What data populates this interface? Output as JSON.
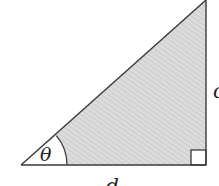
{
  "diagram": {
    "type": "right-triangle",
    "labels": {
      "angle": "θ",
      "base": "d",
      "side": "c"
    },
    "colors": {
      "stroke": "#3a3a3a",
      "fill": "#d9d9d9",
      "hatch": "#c4c4c4",
      "arc_fill": "#ffffff",
      "background": "#ffffff"
    }
  }
}
